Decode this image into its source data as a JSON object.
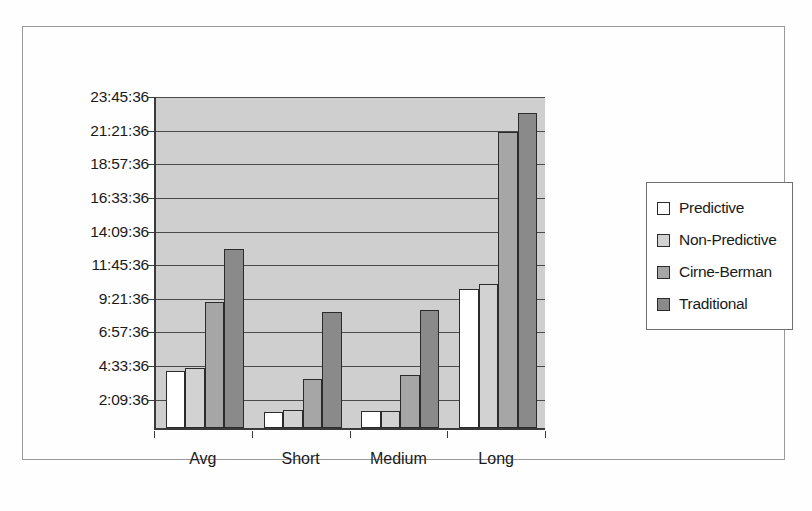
{
  "chart_data": {
    "type": "bar",
    "title": "",
    "xlabel": "",
    "ylabel": "",
    "categories": [
      "Avg",
      "Short",
      "Medium",
      "Long"
    ],
    "series": [
      {
        "name": "Predictive",
        "color": "#ffffff",
        "values": [
          4.1,
          1.15,
          1.2,
          9.9
        ]
      },
      {
        "name": "Non-Predictive",
        "color": "#d2d2d2",
        "values": [
          4.25,
          1.3,
          1.2,
          10.3
        ]
      },
      {
        "name": "Cirne-Berman",
        "color": "#a6a6a6",
        "values": [
          9.0,
          3.5,
          3.8,
          21.1
        ]
      },
      {
        "name": "Traditional",
        "color": "#8a8a8a",
        "values": [
          12.8,
          8.3,
          8.4,
          22.5
        ]
      }
    ],
    "value_unit": "hours",
    "ylim": [
      0,
      23.76
    ],
    "ytick_values": [
      2.16,
      4.56,
      6.96,
      9.36,
      11.76,
      14.16,
      16.56,
      18.96,
      21.36,
      23.76
    ],
    "ytick_labels": [
      "2:09:36",
      "4:33:36",
      "6:57:36",
      "9:21:36",
      "11:45:36",
      "14:09:36",
      "16:33:36",
      "18:57:36",
      "21:21:36",
      "23:45:36"
    ],
    "grid": true,
    "legend_position": "right",
    "legend_entries": [
      "Predictive",
      "Non-Predictive",
      "Cirne-Berman",
      "Traditional"
    ],
    "plot_background": "#cfcfcf",
    "figure_background": "#fefefe"
  }
}
